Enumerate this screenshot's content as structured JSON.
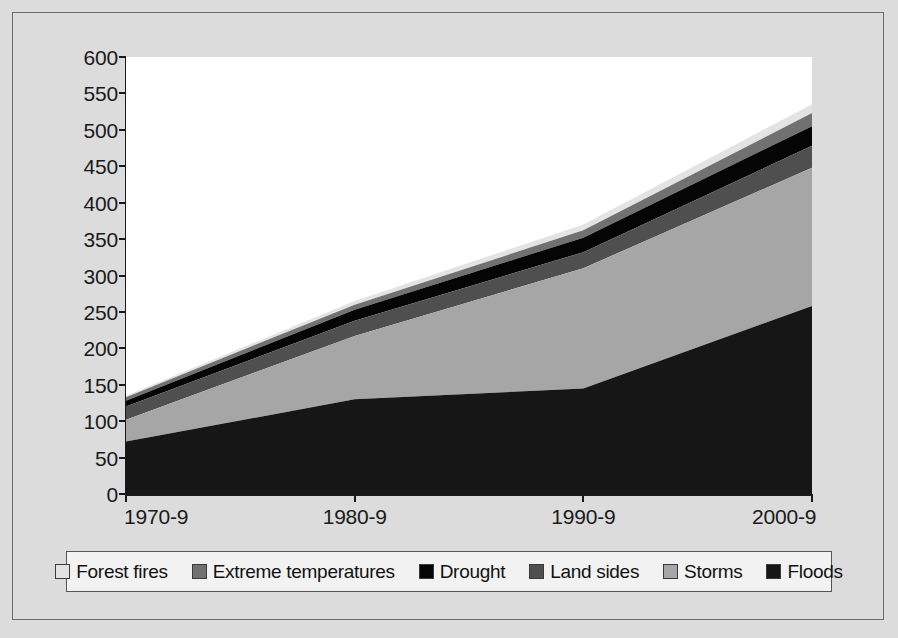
{
  "chart_data": {
    "type": "area",
    "title": "",
    "subtitle": "",
    "xlabel": "",
    "ylabel": "",
    "stacked": true,
    "grid": false,
    "legend_position": "bottom",
    "categories": [
      "1970-9",
      "1980-9",
      "1990-9",
      "2000-9"
    ],
    "ylim": [
      0,
      600
    ],
    "yticks": [
      0,
      50,
      100,
      150,
      200,
      250,
      300,
      350,
      400,
      450,
      500,
      550,
      600
    ],
    "ytick_labels": [
      "0",
      "50",
      "100",
      "150",
      "200",
      "250",
      "300",
      "350",
      "400",
      "450",
      "500",
      "550",
      "600"
    ],
    "series": [
      {
        "name": "Floods",
        "color": "#161616",
        "values": [
          72,
          130,
          145,
          258
        ]
      },
      {
        "name": "Storms",
        "color": "#a6a6a6",
        "values": [
          30,
          87,
          165,
          190
        ]
      },
      {
        "name": "Land sides",
        "color": "#4f4f4f",
        "values": [
          18,
          21,
          22,
          30
        ]
      },
      {
        "name": "Drought",
        "color": "#050505",
        "values": [
          8,
          15,
          20,
          27
        ]
      },
      {
        "name": "Extreme temperatures",
        "color": "#717171",
        "values": [
          5,
          7,
          10,
          18
        ]
      },
      {
        "name": "Forest fires",
        "color": "#e3e3e3",
        "values": [
          2,
          5,
          8,
          12
        ]
      }
    ],
    "cumulative_tops": {
      "1970-9": [
        72,
        102,
        120,
        128,
        133,
        135
      ],
      "1980-9": [
        130,
        217,
        238,
        253,
        260,
        265
      ],
      "1990-9": [
        145,
        310,
        332,
        352,
        362,
        370
      ],
      "2000-9": [
        258,
        448,
        478,
        505,
        523,
        535
      ]
    },
    "totals": [
      135,
      265,
      370,
      535
    ]
  },
  "legend": {
    "items": [
      {
        "label": "Forest fires",
        "color": "#e3e3e3"
      },
      {
        "label": "Extreme temperatures",
        "color": "#717171"
      },
      {
        "label": "Drought",
        "color": "#050505"
      },
      {
        "label": "Land sides",
        "color": "#4f4f4f"
      },
      {
        "label": "Storms",
        "color": "#a6a6a6"
      },
      {
        "label": "Floods",
        "color": "#161616"
      }
    ]
  },
  "style": {
    "page_background": "#dcdcdc",
    "plot_background": "#ffffff",
    "axis_color": "#1a1a1a",
    "frame_color": "#6a6a6a",
    "legend_background": "#f2f2f2"
  }
}
